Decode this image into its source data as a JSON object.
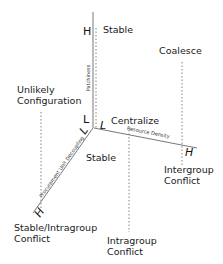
{
  "axes": {
    "vertical": {
      "name": "Patchiness",
      "high": "H",
      "low": "L"
    },
    "horizontal": {
      "name": "Resource Density",
      "high": "H",
      "low": "L"
    },
    "diagonal": {
      "name": "Procurement Unit Decoupling",
      "high": "H",
      "low": "L"
    }
  },
  "outcomes": {
    "top": "Stable",
    "coalesce": "Coalesce",
    "unlikely_1": "Unlikely",
    "unlikely_2": "Configuration",
    "centralize": "Centralize",
    "origin": "Stable",
    "intergroup_1": "Intergroup",
    "intergroup_2": "Conflict",
    "stable_intra_1": "Stable/Intragroup",
    "stable_intra_2": "Conflict",
    "intragroup_1": "Intragroup",
    "intragroup_2": "Conflict"
  },
  "colors": {
    "line": "#555555",
    "dotted": "#666666",
    "text": "#1a1a1a"
  }
}
